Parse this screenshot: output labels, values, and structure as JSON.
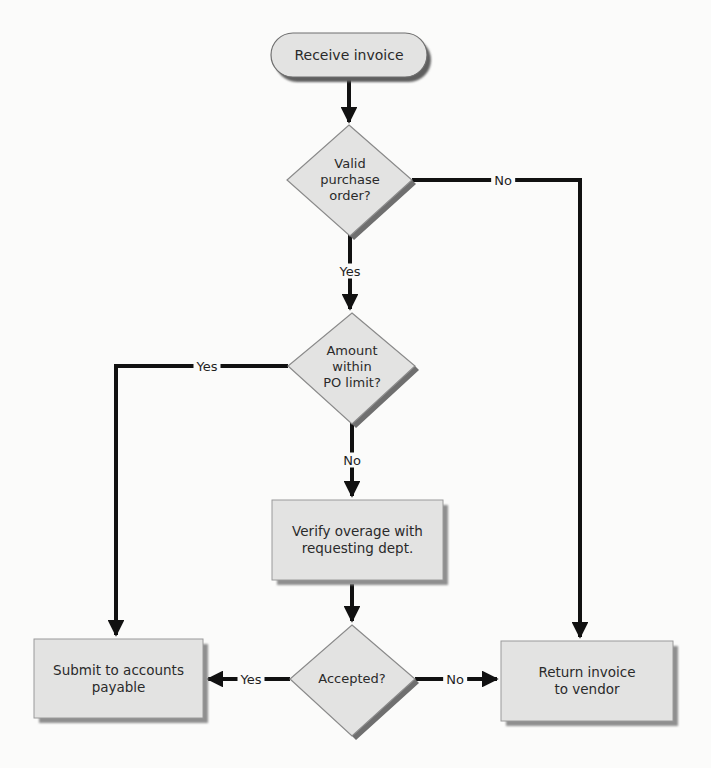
{
  "diagram": {
    "type": "flowchart",
    "colors": {
      "background": "#fbfbfa",
      "node_fill": "#e3e3e2",
      "node_border": "#8a8a8a",
      "node_shadow": "#6f6f6f",
      "edge": "#111111",
      "text": "#2a2a2a"
    },
    "nodes": {
      "start": {
        "shape": "terminal",
        "label": "Receive invoice"
      },
      "valid_po": {
        "shape": "decision",
        "label": "Valid\npurchase\norder?"
      },
      "within_limit": {
        "shape": "decision",
        "label": "Amount\nwithin\nPO limit?"
      },
      "verify": {
        "shape": "process",
        "label": "Verify overage with\nrequesting dept."
      },
      "accepted": {
        "shape": "decision",
        "label": "Accepted?"
      },
      "submit": {
        "shape": "process",
        "label": "Submit to accounts\npayable"
      },
      "return": {
        "shape": "process",
        "label": "Return invoice\nto vendor"
      }
    },
    "edges": [
      {
        "from": "start",
        "to": "valid_po",
        "label": ""
      },
      {
        "from": "valid_po",
        "to": "within_limit",
        "label": "Yes"
      },
      {
        "from": "valid_po",
        "to": "return",
        "label": "No"
      },
      {
        "from": "within_limit",
        "to": "submit",
        "label": "Yes"
      },
      {
        "from": "within_limit",
        "to": "verify",
        "label": "No"
      },
      {
        "from": "verify",
        "to": "accepted",
        "label": ""
      },
      {
        "from": "accepted",
        "to": "submit",
        "label": "Yes"
      },
      {
        "from": "accepted",
        "to": "return",
        "label": "No"
      }
    ],
    "edge_labels": {
      "valid_no": "No",
      "valid_yes": "Yes",
      "limit_yes": "Yes",
      "limit_no": "No",
      "accepted_yes": "Yes",
      "accepted_no": "No"
    }
  }
}
